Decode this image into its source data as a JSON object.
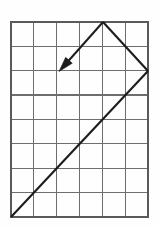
{
  "figure": {
    "background_color": "#fefefe"
  },
  "grid": {
    "columns": 6,
    "rows": 8,
    "origin_x": 11,
    "origin_y": 22,
    "cell_width": 22.83,
    "cell_height": 24.37,
    "line_color": "#6e6e6e",
    "border_color": "#5a5a5a",
    "line_width": 1.25,
    "border_width": 1.6
  },
  "chart_data": {
    "type": "line",
    "xlabel": "",
    "ylabel": "",
    "grid": true,
    "legend_position": "none",
    "xlim": [
      0,
      6
    ],
    "ylim": [
      0,
      8
    ],
    "series": [
      {
        "name": "path-segment-1",
        "description": "Long diagonal from bottom-left grid corner up-right to right edge",
        "x": [
          0,
          6
        ],
        "y": [
          0,
          6
        ]
      },
      {
        "name": "path-segment-2",
        "description": "Diagonal from right edge up-left to apex on top edge",
        "x": [
          6,
          4
        ],
        "y": [
          6,
          8
        ]
      },
      {
        "name": "resultant-arrow",
        "description": "Arrow from apex pointing down-left",
        "x": [
          4,
          2.15
        ],
        "y": [
          8,
          6.05
        ],
        "arrow": true,
        "arrow_at": "end"
      }
    ]
  },
  "geometry": {
    "stroke_color": "#1c1c1c",
    "path_stroke_width": 2.1,
    "arrow_stroke_width": 2.0,
    "segment_1": {
      "x1": 11,
      "y1": 217,
      "x2": 148,
      "y2": 71
    },
    "segment_2": {
      "x1": 148,
      "y1": 71,
      "x2": 103,
      "y2": 22
    },
    "arrow_shaft": {
      "x1": 103,
      "y1": 22,
      "x2": 63,
      "y2": 67
    },
    "arrow_head_tip": {
      "x": 59,
      "y": 71.5
    },
    "arrow_head_length": 15,
    "arrow_head_half_width": 4.4
  }
}
